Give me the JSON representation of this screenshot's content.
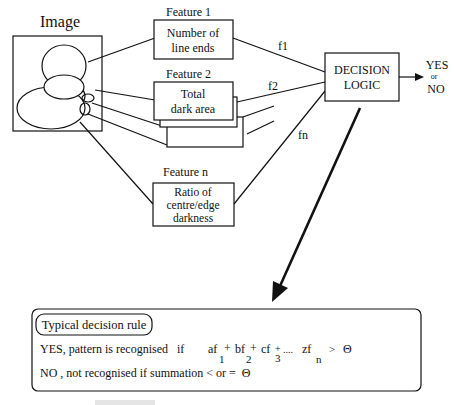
{
  "image_block": {
    "title": "Image"
  },
  "features": [
    {
      "heading": "Feature 1",
      "lines": [
        "Number of",
        "line ends"
      ],
      "signal": "f1"
    },
    {
      "heading": "Feature 2",
      "lines": [
        "Total",
        "dark area"
      ],
      "signal": "f2"
    },
    {
      "heading": "Feature  n",
      "lines": [
        "Ratio of",
        "centre/edge",
        "darkness"
      ],
      "signal": "fn"
    }
  ],
  "decision": {
    "lines": [
      "DECISION",
      "LOGIC"
    ]
  },
  "output": {
    "yes": "YES",
    "or": "or",
    "no": "NO"
  },
  "rule_box": {
    "title": "Typical decision rule",
    "yes_prefix": "YES, pattern is recognised   if",
    "terms": [
      {
        "coef": "af",
        "sub": "1",
        "op": "+"
      },
      {
        "coef": "bf",
        "sub": "2",
        "op": "+"
      },
      {
        "coef": "cf",
        "sub": "3",
        "op": "+"
      }
    ],
    "ellipsis": "....",
    "last_term": {
      "coef": "zf",
      "sub": "n"
    },
    "gt": ">",
    "theta": "Θ",
    "no_line": "NO , not recognised if summation < or =  Θ"
  }
}
